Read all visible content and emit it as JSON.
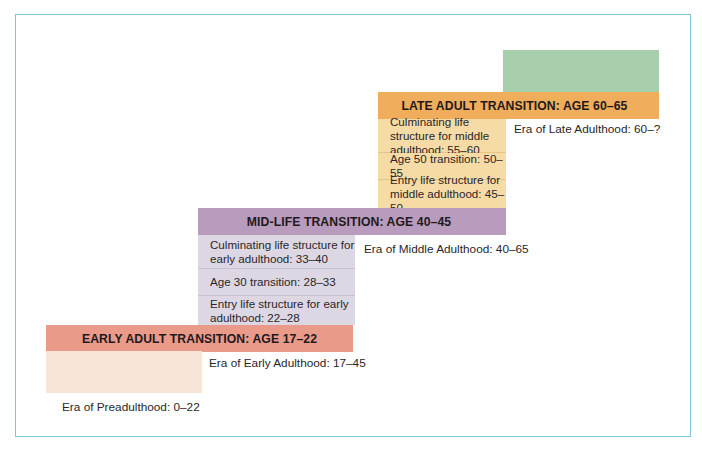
{
  "diagram": {
    "colors": {
      "frame_border": "#7cc6da",
      "late_adulthood_era": "#a8cfac",
      "late_adult_transition": "#f0ad5c",
      "middle_adulthood_substages": "#f6dba6",
      "mid_life_transition": "#b99bbd",
      "early_adulthood_substages": "#ddd7e4",
      "early_adult_transition": "#e99a89",
      "preadulthood_era": "#f8e4d9"
    },
    "transitions": {
      "late": "LATE ADULT TRANSITION: AGE 60–65",
      "mid": "MID-LIFE TRANSITION: AGE 40–45",
      "early": "EARLY ADULT TRANSITION: AGE 17–22"
    },
    "middle_adulthood_stages": [
      "Culminating life structure for middle adulthood: 55–60",
      "Age 50 transition: 50–55",
      "Entry life structure for middle adulthood: 45–50"
    ],
    "early_adulthood_stages": [
      "Culminating life structure for early adulthood: 33–40",
      "Age 30 transition: 28–33",
      "Entry life structure for early adulthood: 22–28"
    ],
    "eras": {
      "late": "Era of Late Adulthood: 60–?",
      "middle": "Era of Middle Adulthood: 40–65",
      "early": "Era of Early Adulthood: 17–45",
      "pre": "Era of Preadulthood: 0–22"
    }
  }
}
